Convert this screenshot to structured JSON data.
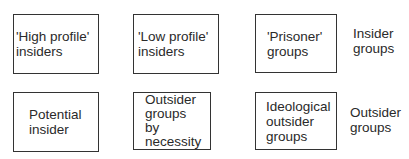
{
  "rows": [
    {
      "boxes": [
        {
          "text": "'High profile'\ninsiders"
        },
        {
          "text": "'Low profile'\ninsiders"
        },
        {
          "text": "'Prisoner'\ngroups"
        }
      ],
      "label": "Insider\ngroups"
    },
    {
      "boxes": [
        {
          "text": "Potential\ninsider"
        },
        {
          "text": "Outsider\ngroups\nby\nnecessity"
        },
        {
          "text": "Ideological\noutsider\ngroups"
        }
      ],
      "label": "Outsider\ngroups"
    }
  ]
}
